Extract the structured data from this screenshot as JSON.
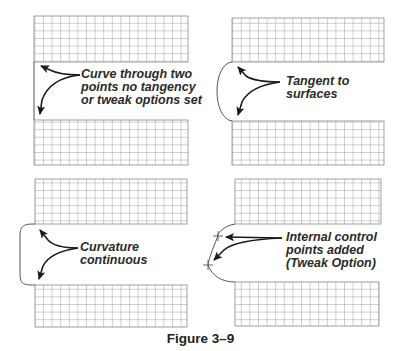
{
  "figure": {
    "caption": "Figure 3–9",
    "panels": [
      {
        "id": "no-tangency",
        "label_lines": [
          "Curve through two",
          "points no tangency",
          "or tweak options set"
        ],
        "curve_type": "straight"
      },
      {
        "id": "tangent",
        "label_lines": [
          "Tangent to",
          "surfaces"
        ],
        "curve_type": "tangent"
      },
      {
        "id": "curvature",
        "label_lines": [
          "Curvature",
          "continuous"
        ],
        "curve_type": "curvature"
      },
      {
        "id": "tweak",
        "label_lines": [
          "Internal control",
          "points added",
          "(Tweak Option)"
        ],
        "curve_type": "tweak-control-points"
      }
    ]
  },
  "colors": {
    "grid_line": "#8a8a8a",
    "curve": "#555555",
    "arrow": "#1a1a1a",
    "text": "#2a2a2a"
  }
}
